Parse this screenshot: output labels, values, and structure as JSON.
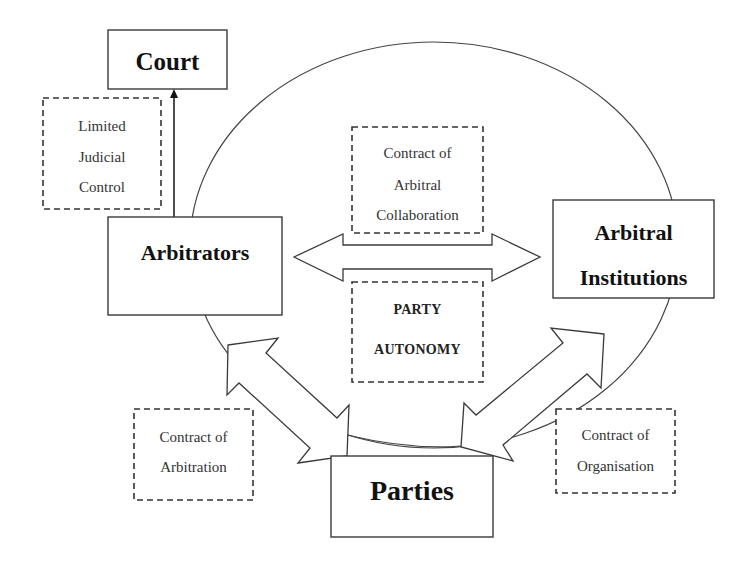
{
  "diagram": {
    "nodes": {
      "court": {
        "label": "Court"
      },
      "arbitrators": {
        "label": "Arbitrators"
      },
      "institutions": {
        "line1": "Arbitral",
        "line2": "Institutions"
      },
      "parties": {
        "label": "Parties"
      }
    },
    "relations": {
      "judicial_control": {
        "lines": [
          "Limited",
          "Judicial",
          "Control"
        ]
      },
      "arbitral_collaboration": {
        "lines": [
          "Contract of",
          "Arbitral",
          "Collaboration"
        ]
      },
      "party_autonomy": {
        "lines": [
          "PARTY",
          "AUTONOMY"
        ]
      },
      "arbitration": {
        "lines": [
          "Contract of",
          "Arbitration"
        ]
      },
      "organisation": {
        "lines": [
          "Contract of",
          "Organisation"
        ]
      }
    },
    "colors": {
      "background": "#ffffff",
      "stroke": "#3a3a3a",
      "text": "#111111"
    }
  }
}
